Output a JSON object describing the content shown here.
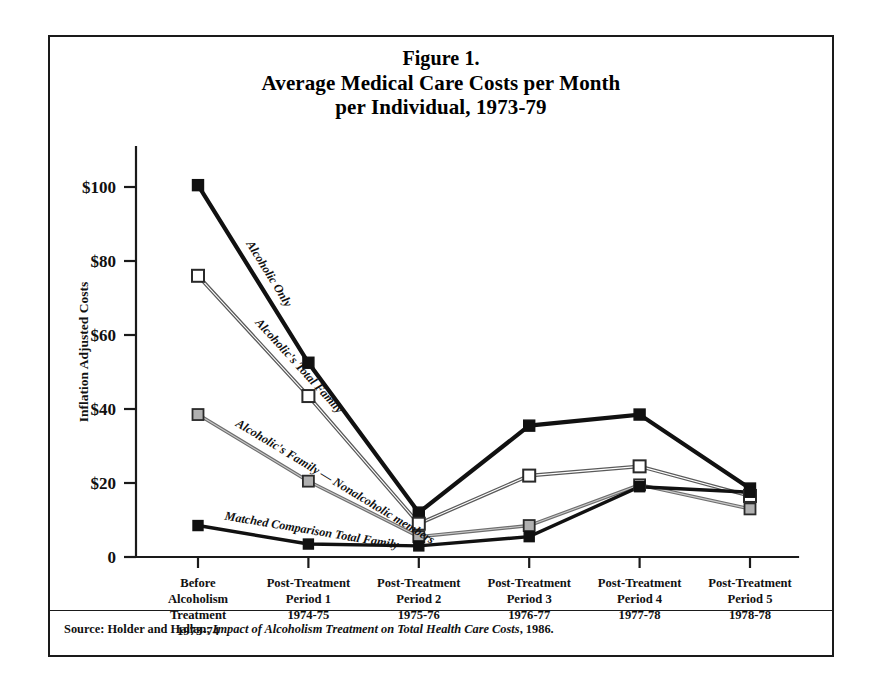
{
  "figure": {
    "title_lines": [
      "Figure 1.",
      "Average Medical Care Costs per Month",
      "per Individual, 1973-79"
    ],
    "source_prefix": "Source: Holder and Hallan, ",
    "source_italic": "Impact of Alcoholism Treatment on Total Health Care Costs",
    "source_suffix": ", 1986."
  },
  "chart_data": {
    "type": "line",
    "title": "Figure 1. Average Medical Care Costs per Month per Individual, 1973-79",
    "xlabel": "",
    "ylabel": "Inflation Adjusted Costs",
    "ylim": [
      0,
      100
    ],
    "yticks": [
      0,
      20,
      40,
      60,
      80,
      100
    ],
    "ytick_labels": [
      "0",
      "$20",
      "$40",
      "$60",
      "$80",
      "$100"
    ],
    "grid": false,
    "legend_position": "inline-labels",
    "categories": [
      "Before Alcoholism Treatment 1973-74",
      "Post-Treatment Period 1 1974-75",
      "Post-Treatment Period 2 1975-76",
      "Post-Treatment Period 3 1976-77",
      "Post-Treatment Period 4 1977-78",
      "Post-Treatment Period 5 1978-78"
    ],
    "category_lines": [
      [
        "Before",
        "Alcoholism",
        "Treatment",
        "1973-74"
      ],
      [
        "Post-Treatment",
        "Period 1",
        "1974-75"
      ],
      [
        "Post-Treatment",
        "Period 2",
        "1975-76"
      ],
      [
        "Post-Treatment",
        "Period 3",
        "1976-77"
      ],
      [
        "Post-Treatment",
        "Period 4",
        "1977-78"
      ],
      [
        "Post-Treatment",
        "Period 5",
        "1978-78"
      ]
    ],
    "series": [
      {
        "name": "Alcoholic Only",
        "marker": "filled-square",
        "values": [
          100.5,
          52.5,
          12.0,
          35.5,
          38.5,
          18.5
        ]
      },
      {
        "name": "Alcoholic's Total Family",
        "marker": "open-square",
        "values": [
          76.0,
          43.5,
          9.0,
          22.0,
          24.5,
          16.5
        ]
      },
      {
        "name": "Alcoholic's Family — Nonalcoholic members",
        "marker": "gray-square",
        "values": [
          38.5,
          20.5,
          5.5,
          8.5,
          19.5,
          13.0
        ]
      },
      {
        "name": "Matched Comparison Total Family",
        "marker": "filled-square",
        "values": [
          8.5,
          3.5,
          3.0,
          5.5,
          19.0,
          17.5
        ]
      }
    ],
    "annotations": [
      {
        "text": "Alcoholic Only",
        "series": "Alcoholic Only"
      },
      {
        "text": "Alcoholic's Total Family",
        "series": "Alcoholic's Total Family"
      },
      {
        "text": "Alcoholic's Family — Nonalcoholic members",
        "series": "Alcoholic's Family — Nonalcoholic members"
      },
      {
        "text": "Matched Comparison Total Family",
        "series": "Matched Comparison Total Family"
      }
    ]
  }
}
